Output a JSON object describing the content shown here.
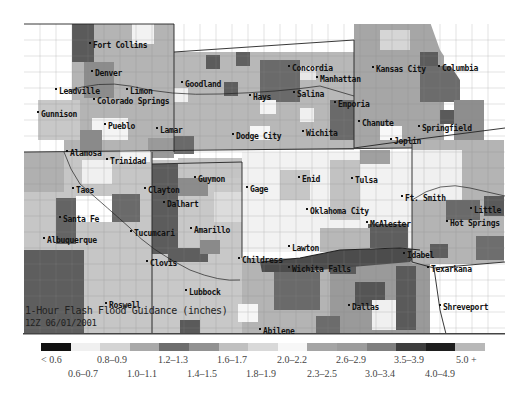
{
  "map": {
    "title": "1-Hour Flash Flood Guidance (inches)",
    "date": "12Z 06/01/2001",
    "cities": [
      {
        "name": "Fort Collins",
        "x": 93,
        "y": 41
      },
      {
        "name": "Denver",
        "x": 95,
        "y": 69
      },
      {
        "name": "Leadville",
        "x": 59,
        "y": 87
      },
      {
        "name": "Limon",
        "x": 130,
        "y": 87
      },
      {
        "name": "Colorado Springs",
        "x": 97,
        "y": 97
      },
      {
        "name": "Gunnison",
        "x": 41,
        "y": 110
      },
      {
        "name": "Pueblo",
        "x": 108,
        "y": 122
      },
      {
        "name": "Lamar",
        "x": 160,
        "y": 126
      },
      {
        "name": "Alamosa",
        "x": 70,
        "y": 149
      },
      {
        "name": "Trinidad",
        "x": 110,
        "y": 157
      },
      {
        "name": "Goodland",
        "x": 185,
        "y": 80
      },
      {
        "name": "Hays",
        "x": 253,
        "y": 93
      },
      {
        "name": "Concordia",
        "x": 292,
        "y": 64
      },
      {
        "name": "Manhattan",
        "x": 320,
        "y": 75
      },
      {
        "name": "Salina",
        "x": 297,
        "y": 90
      },
      {
        "name": "Emporia",
        "x": 338,
        "y": 100
      },
      {
        "name": "Kansas City",
        "x": 376,
        "y": 65
      },
      {
        "name": "Columbia",
        "x": 442,
        "y": 64
      },
      {
        "name": "Dodge City",
        "x": 236,
        "y": 132
      },
      {
        "name": "Wichita",
        "x": 306,
        "y": 129
      },
      {
        "name": "Chanute",
        "x": 362,
        "y": 119
      },
      {
        "name": "Springfield",
        "x": 422,
        "y": 124
      },
      {
        "name": "Joplin",
        "x": 394,
        "y": 137
      },
      {
        "name": "Taos",
        "x": 76,
        "y": 186
      },
      {
        "name": "Clayton",
        "x": 148,
        "y": 186
      },
      {
        "name": "Guymon",
        "x": 198,
        "y": 175
      },
      {
        "name": "Gage",
        "x": 250,
        "y": 185
      },
      {
        "name": "Enid",
        "x": 302,
        "y": 175
      },
      {
        "name": "Tulsa",
        "x": 355,
        "y": 176
      },
      {
        "name": "Dalhart",
        "x": 167,
        "y": 200
      },
      {
        "name": "Santa Fe",
        "x": 63,
        "y": 215
      },
      {
        "name": "Oklahoma City",
        "x": 310,
        "y": 207
      },
      {
        "name": "Ft. Smith",
        "x": 405,
        "y": 194
      },
      {
        "name": "Little",
        "x": 474,
        "y": 206
      },
      {
        "name": "Hot Springs",
        "x": 450,
        "y": 219
      },
      {
        "name": "McAlester",
        "x": 370,
        "y": 220
      },
      {
        "name": "Tucumcari",
        "x": 134,
        "y": 229
      },
      {
        "name": "Amarillo",
        "x": 194,
        "y": 226
      },
      {
        "name": "Albuquerque",
        "x": 47,
        "y": 236
      },
      {
        "name": "Lawton",
        "x": 292,
        "y": 244
      },
      {
        "name": "Childress",
        "x": 242,
        "y": 256
      },
      {
        "name": "Idabel",
        "x": 407,
        "y": 251
      },
      {
        "name": "Clovis",
        "x": 150,
        "y": 259
      },
      {
        "name": "Wichita Falls",
        "x": 292,
        "y": 265
      },
      {
        "name": "Texarkana",
        "x": 431,
        "y": 265
      },
      {
        "name": "Lubbock",
        "x": 189,
        "y": 288
      },
      {
        "name": "Roswell",
        "x": 109,
        "y": 301
      },
      {
        "name": "Dallas",
        "x": 352,
        "y": 303
      },
      {
        "name": "Shreveport",
        "x": 443,
        "y": 303
      },
      {
        "name": "Abilene",
        "x": 263,
        "y": 327
      }
    ]
  },
  "legend": {
    "colors": [
      "#111111",
      "#f0f0f0",
      "#d4d4d4",
      "#a9a9a9",
      "#6e6e6e",
      "#929292",
      "#c0c0c0",
      "#d9d9d9",
      "#f7f7f7",
      "#a5a5a5",
      "#9c9c9c",
      "#7f7f7f",
      "#3e3e3e",
      "#1e1e1e",
      "#b8b8b8"
    ],
    "top_labels": [
      {
        "text": "< 0.6",
        "x": 0
      },
      {
        "text": "0.8–0.9",
        "x": 56
      },
      {
        "text": "1.2–1.3",
        "x": 117
      },
      {
        "text": "1.6–1.7",
        "x": 176
      },
      {
        "text": "2.0–2.2",
        "x": 236
      },
      {
        "text": "2.6–2.9",
        "x": 295
      },
      {
        "text": "3.5–3.9",
        "x": 353
      },
      {
        "text": "5.0 +",
        "x": 415
      }
    ],
    "bottom_labels": [
      {
        "text": "0.6–0.7",
        "x": 27
      },
      {
        "text": "1.0–1.1",
        "x": 86
      },
      {
        "text": "1.4–1.5",
        "x": 146
      },
      {
        "text": "1.8–1.9",
        "x": 205
      },
      {
        "text": "2.3–2.5",
        "x": 266
      },
      {
        "text": "3.0–3.4",
        "x": 324
      },
      {
        "text": "4.0–4.9",
        "x": 384
      }
    ]
  },
  "chart_data": {
    "type": "heatmap",
    "title": "1-Hour Flash Flood Guidance (inches)",
    "subtitle": "12Z 06/01/2001",
    "legend_categories": [
      "< 0.6",
      "0.6–0.7",
      "0.8–0.9",
      "1.0–1.1",
      "1.2–1.3",
      "1.4–1.5",
      "1.6–1.7",
      "1.8–1.9",
      "2.0–2.2",
      "2.3–2.5",
      "2.6–2.9",
      "3.0–3.4",
      "3.5–3.9",
      "4.0–4.9",
      "5.0 +"
    ],
    "legend_position": "bottom",
    "regions": [
      "Colorado",
      "Kansas",
      "Missouri",
      "New Mexico",
      "Oklahoma",
      "Texas",
      "Arkansas",
      "Louisiana"
    ]
  }
}
